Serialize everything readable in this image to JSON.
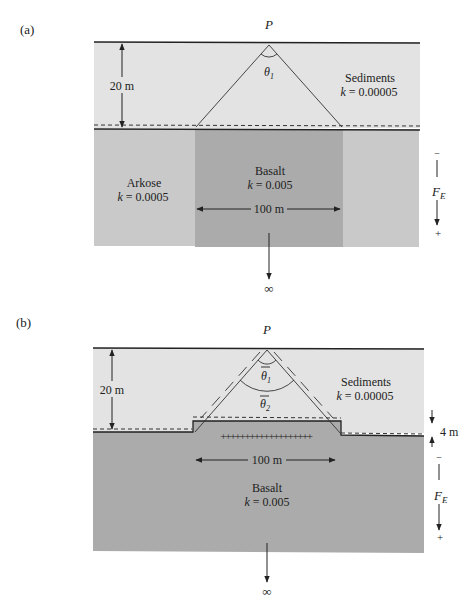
{
  "figure": {
    "panels": [
      {
        "id": "a",
        "panel_label": "(a)",
        "point_label": "P",
        "angle_label": "θ",
        "angle_sub": "1",
        "depth_label": "20 m",
        "width_label": "100 m",
        "infinity_label": "∞",
        "field_label": "F",
        "field_sub": "E",
        "field_minus": "−",
        "field_plus": "+",
        "layers": {
          "sediments": {
            "name": "Sediments",
            "k_prefix": "k",
            "k_value": " = 0.00005",
            "color": "#e3e3e3"
          },
          "arkose": {
            "name": "Arkose",
            "k_prefix": "k",
            "k_value": " = 0.0005",
            "color": "#c9c9c9"
          },
          "basalt": {
            "name": "Basalt",
            "k_prefix": "k",
            "k_value": " = 0.005",
            "color": "#ababab"
          }
        }
      },
      {
        "id": "b",
        "panel_label": "(b)",
        "point_label": "P",
        "angle1_label": "θ",
        "angle1_sub": "1",
        "angle2_label": "θ",
        "angle2_sub": "2",
        "depth_label": "20 m",
        "step_label": "4 m",
        "width_label": "100 m",
        "infinity_label": "∞",
        "field_label": "F",
        "field_sub": "E",
        "field_minus": "−",
        "field_plus": "+",
        "charge_marks": "+++++++++++++++++++",
        "layers": {
          "sediments": {
            "name": "Sediments",
            "k_prefix": "k",
            "k_value": " = 0.00005",
            "color": "#e3e3e3"
          },
          "basalt": {
            "name": "Basalt",
            "k_prefix": "k",
            "k_value": " = 0.005",
            "color": "#ababab"
          }
        }
      }
    ]
  }
}
